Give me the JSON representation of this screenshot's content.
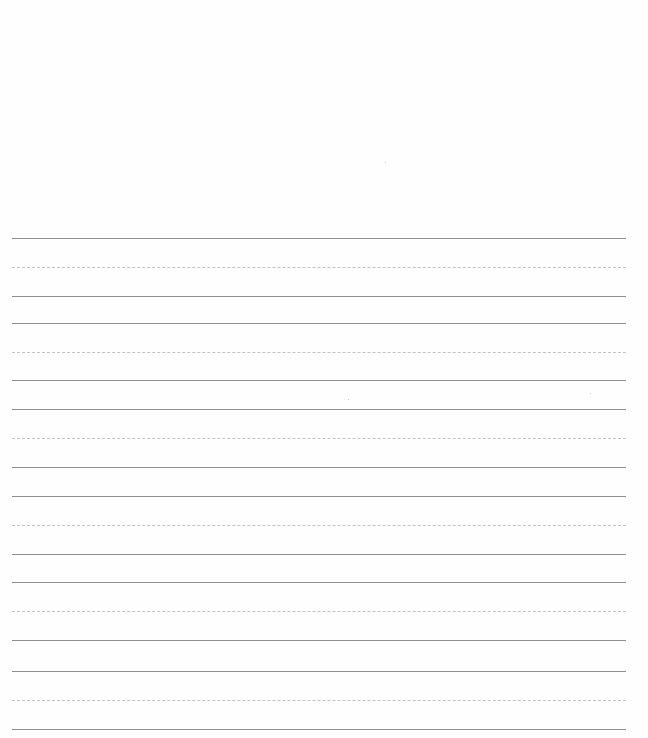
{
  "page": {
    "type": "handwriting practice sheet",
    "background": "#ffffff",
    "line_color": "#8f8f8f",
    "guide_color": "#c2c2c2"
  },
  "rows": [
    {
      "top": 238,
      "mid": 267,
      "base": 296
    },
    {
      "top": 323,
      "mid": 352,
      "base": 380
    },
    {
      "top": 409,
      "mid": 438,
      "base": 467
    },
    {
      "top": 496,
      "mid": 525,
      "base": 554
    },
    {
      "top": 582,
      "mid": 611,
      "base": 640
    },
    {
      "top": 671,
      "mid": 700,
      "base": 729
    }
  ]
}
